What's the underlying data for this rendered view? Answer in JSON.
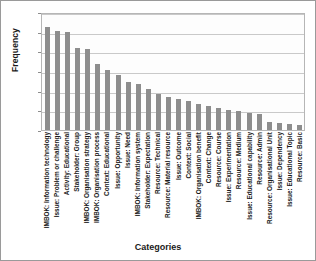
{
  "chart_data": {
    "type": "bar",
    "title": "",
    "xlabel": "Categories",
    "ylabel": "Frequency",
    "ylim": [
      0,
      120
    ],
    "yticks": [
      0,
      20,
      40,
      60,
      80,
      100,
      120
    ],
    "ytick_labels": [
      "0",
      "20",
      "40",
      "60",
      "80",
      "100",
      "120"
    ],
    "grid": true,
    "legend": "none",
    "bar_color": "#8d8d8d",
    "categories": [
      "IMBOK: Information technology",
      "Issue: Problem or challenge",
      "Activity: Educational",
      "Stakeholder: Group",
      "IMBOK: Organisation strategy",
      "IMBOK: Organisation process",
      "Context: Educational",
      "Issue: Opportunity",
      "Issue: Need",
      "IMBOK: Information system",
      "Stakeholder: Expectation",
      "Resource: Technical",
      "Resource: Material resource",
      "Issue: Outcome",
      "Context: Social",
      "IMBOK: Organisation benefit",
      "Context: Change",
      "Resource: Course",
      "Issue: Experimentation",
      "Resource: Medium",
      "Issue: Educational capability",
      "Resource: Admin",
      "Resource: Organisational Unit",
      "Issue: Dependency",
      "Issue: Educational Topic",
      "Resource: Basic"
    ],
    "values": [
      105,
      101,
      100,
      83,
      82,
      67,
      61,
      56,
      49,
      47,
      42,
      37,
      34,
      32,
      29,
      26,
      24,
      22,
      20,
      19,
      17,
      16,
      8,
      7,
      6,
      5
    ]
  }
}
